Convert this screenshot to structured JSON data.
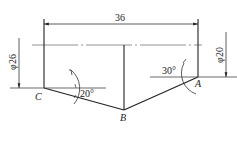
{
  "diagram": {
    "type": "technical-drawing",
    "dimensions": {
      "width_label": "36",
      "left_diameter": "φ26",
      "right_diameter": "φ20"
    },
    "angles": {
      "at_C": "20°",
      "at_A": "30°"
    },
    "points": {
      "A": "A",
      "B": "B",
      "C": "C"
    },
    "colors": {
      "line": "#222222",
      "thin": "#555555",
      "background": "#ffffff"
    }
  }
}
